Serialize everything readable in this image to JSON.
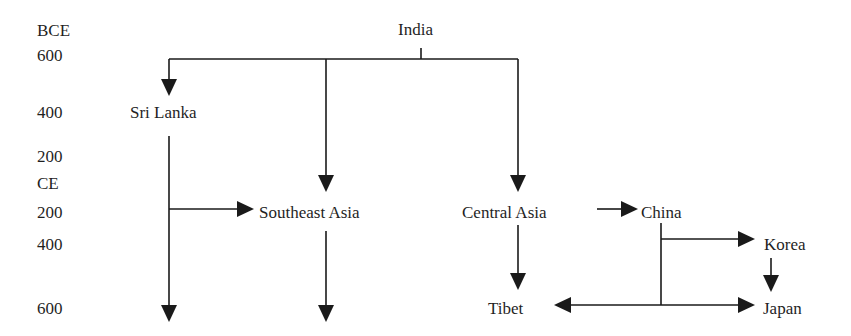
{
  "timeline": {
    "labels": [
      {
        "text": "BCE",
        "y": 22
      },
      {
        "text": "600",
        "y": 47
      },
      {
        "text": "400",
        "y": 104
      },
      {
        "text": "200",
        "y": 148
      },
      {
        "text": "CE",
        "y": 175
      },
      {
        "text": "200",
        "y": 204
      },
      {
        "text": "400",
        "y": 236
      },
      {
        "text": "600",
        "y": 300
      }
    ]
  },
  "nodes": {
    "india": "India",
    "sri_lanka": "Sri Lanka",
    "southeast_asia": "Southeast Asia",
    "central_asia": "Central Asia",
    "china": "China",
    "korea": "Korea",
    "tibet": "Tibet",
    "japan": "Japan"
  },
  "edges": [
    {
      "from": "India",
      "to": "Sri Lanka"
    },
    {
      "from": "India",
      "to": "Southeast Asia"
    },
    {
      "from": "India",
      "to": "Central Asia"
    },
    {
      "from": "Sri Lanka",
      "to": "Southeast Asia"
    },
    {
      "from": "Sri Lanka",
      "to": "(continues, 600 CE)"
    },
    {
      "from": "Southeast Asia",
      "to": "(continues, 600 CE)"
    },
    {
      "from": "Central Asia",
      "to": "China"
    },
    {
      "from": "Central Asia",
      "to": "Tibet"
    },
    {
      "from": "China",
      "to": "Korea"
    },
    {
      "from": "China",
      "to": "Tibet"
    },
    {
      "from": "China",
      "to": "Japan"
    },
    {
      "from": "Korea",
      "to": "Japan"
    }
  ],
  "colors": {
    "line": "#1a1a1a",
    "text": "#1f1f1f",
    "background": "#ffffff"
  }
}
